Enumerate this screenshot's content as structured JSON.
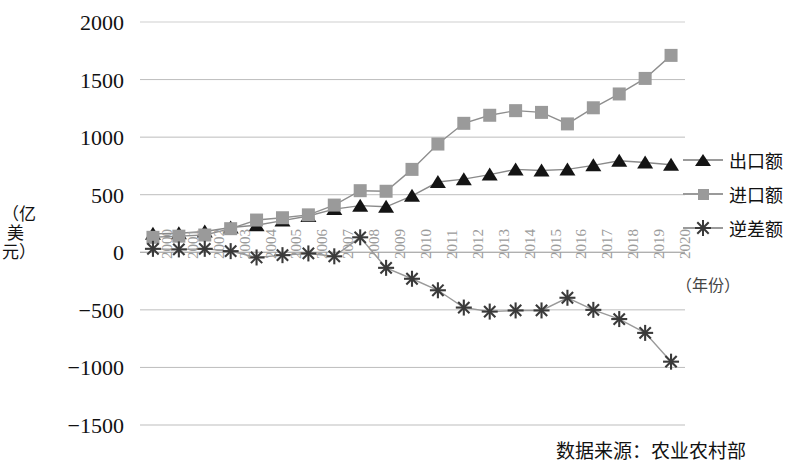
{
  "chart_data": {
    "type": "line",
    "title": "",
    "xlabel": "（年份）",
    "ylabel": "（亿美元）",
    "ylim": [
      -1500,
      2000
    ],
    "ytick_labels": [
      "2000",
      "1500",
      "1000",
      "500",
      "0",
      "−500",
      "−1000",
      "−1500"
    ],
    "ytick_values": [
      2000,
      1500,
      1000,
      500,
      0,
      -500,
      -1000,
      -1500
    ],
    "grid": true,
    "legend_position": "right",
    "categories": [
      "2000",
      "2001",
      "2002",
      "2003",
      "2004",
      "2005",
      "2006",
      "2007",
      "2008",
      "2009",
      "2010",
      "2011",
      "2012",
      "2013",
      "2014",
      "2015",
      "2016",
      "2017",
      "2018",
      "2019",
      "2020"
    ],
    "series": [
      {
        "name": "出口额",
        "marker": "triangle",
        "color": "#141414",
        "values": [
          160,
          165,
          180,
          215,
          235,
          275,
          315,
          375,
          405,
          395,
          490,
          610,
          635,
          675,
          720,
          710,
          720,
          755,
          795,
          780,
          760
        ]
      },
      {
        "name": "进口额",
        "marker": "square",
        "color": "#9a9a9a",
        "values": [
          130,
          140,
          150,
          205,
          280,
          300,
          325,
          410,
          535,
          530,
          720,
          940,
          1120,
          1190,
          1230,
          1215,
          1115,
          1255,
          1375,
          1510,
          1710
        ]
      },
      {
        "name": "逆差额",
        "marker": "asterisk",
        "color": "#3a3a3a",
        "values": [
          30,
          25,
          30,
          10,
          -45,
          -25,
          -10,
          -35,
          130,
          -135,
          -230,
          -330,
          -480,
          -515,
          -505,
          -505,
          -395,
          -500,
          -580,
          -700,
          -950
        ]
      }
    ]
  },
  "legend": {
    "items": [
      {
        "label": "出口额",
        "marker": "triangle",
        "color": "#141414"
      },
      {
        "label": "进口额",
        "marker": "square",
        "color": "#9a9a9a"
      },
      {
        "label": "逆差额",
        "marker": "asterisk",
        "color": "#3a3a3a"
      }
    ]
  },
  "footer": {
    "source": "数据来源：农业农村部"
  }
}
